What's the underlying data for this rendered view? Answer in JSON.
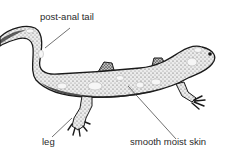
{
  "diagram": {
    "labels": [
      {
        "id": "tail",
        "text": "post-anal tail"
      },
      {
        "id": "leg",
        "text": "leg"
      },
      {
        "id": "skin",
        "text": "smooth moist skin"
      }
    ],
    "colors": {
      "background": "#ffffff",
      "ink": "#1a1a1a",
      "label": "#2a2a2a",
      "body_fill": "#e4e4e4"
    }
  }
}
